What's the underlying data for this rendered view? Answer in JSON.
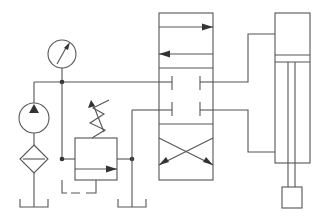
{
  "diagram": {
    "stroke_color": "#555555",
    "fill_color": "#333333",
    "background": "#ffffff",
    "components": [
      {
        "id": "pressure-gauge",
        "type": "pressure gauge"
      },
      {
        "id": "hydraulic-pump",
        "type": "fixed displacement pump"
      },
      {
        "id": "filter",
        "type": "filter"
      },
      {
        "id": "tank-left",
        "type": "reservoir"
      },
      {
        "id": "relief-valve",
        "type": "pressure relief valve, adjustable spring"
      },
      {
        "id": "tank-middle",
        "type": "reservoir"
      },
      {
        "id": "directional-valve",
        "type": "4/3 directional control valve"
      },
      {
        "id": "cylinder",
        "type": "double-acting cylinder with rod"
      },
      {
        "id": "load",
        "type": "load mass"
      }
    ]
  }
}
